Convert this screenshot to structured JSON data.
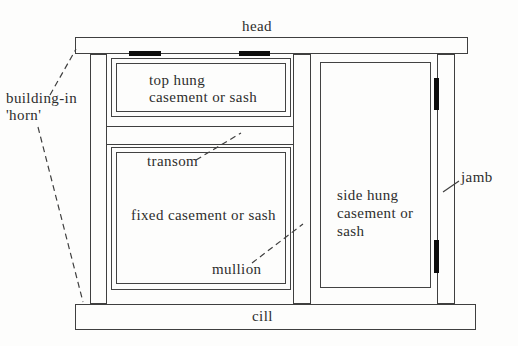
{
  "diagram": {
    "type": "window-construction-terminology",
    "labels": {
      "head": "head",
      "horn": {
        "line1": "building-in",
        "line2": "'horn'"
      },
      "top_hung": {
        "line1": "top hung",
        "line2": "casement or sash"
      },
      "transom": "transom",
      "fixed": "fixed casement or sash",
      "mullion": "mullion",
      "side_hung": {
        "line1": "side hung",
        "line2": "casement or",
        "line3": "sash"
      },
      "jamb": "jamb",
      "cill": "cill"
    },
    "colors": {
      "paper": "#fdfdfc",
      "line": "#3f3f3f",
      "text": "#2d2d2d",
      "hinge_mark": "#0d0d0d"
    }
  }
}
